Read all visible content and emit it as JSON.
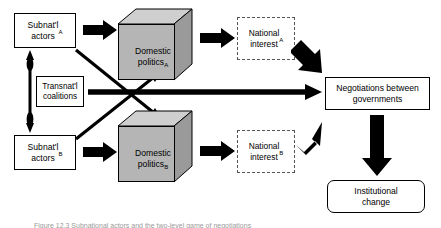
{
  "figure": {
    "caption": "Figure 12.3   Subnational actors and the two-level game of negotiations"
  },
  "nodes": {
    "subnational_actors_a": {
      "label": "Subnat'l\nactors",
      "subscript": "A",
      "shape": "rectangle",
      "border": "solid"
    },
    "subnational_actors_b": {
      "label": "Subnat'l\nactors",
      "subscript": "B",
      "shape": "rectangle",
      "border": "solid"
    },
    "transnational_coalitions": {
      "label": "Transnat'l\ncoalitions",
      "subscript": "",
      "shape": "rectangle",
      "border": "solid"
    },
    "domestic_politics_a": {
      "label": "Domestic\npolitics",
      "subscript": "A",
      "shape": "cube",
      "fill": "#b5b5b5"
    },
    "domestic_politics_b": {
      "label": "Domestic\npolitics",
      "subscript": "B",
      "shape": "cube",
      "fill": "#b5b5b5"
    },
    "national_interest_a": {
      "label": "National\ninterest",
      "subscript": "A",
      "shape": "rectangle",
      "border": "dashed"
    },
    "national_interest_b": {
      "label": "National\ninterest",
      "subscript": "B",
      "shape": "rectangle",
      "border": "dashed"
    },
    "negotiations": {
      "label": "Negotiations between\ngovernments",
      "subscript": "",
      "shape": "rectangle",
      "border": "solid"
    },
    "institutional_change": {
      "label": "Institutional\nchange",
      "subscript": "",
      "shape": "rounded-rectangle",
      "border": "solid"
    }
  },
  "edges": [
    {
      "name": "subnat-a-to-domestic-a",
      "from": "subnational_actors_a",
      "to": "domestic_politics_a",
      "style": "block-arrow",
      "direction": "right"
    },
    {
      "name": "subnat-b-to-domestic-b",
      "from": "subnational_actors_b",
      "to": "domestic_politics_b",
      "style": "block-arrow",
      "direction": "right"
    },
    {
      "name": "domestic-a-to-national-interest-a",
      "from": "domestic_politics_a",
      "to": "national_interest_a",
      "style": "block-arrow",
      "direction": "right"
    },
    {
      "name": "domestic-b-to-national-interest-b",
      "from": "domestic_politics_b",
      "to": "national_interest_b",
      "style": "block-arrow",
      "direction": "right"
    },
    {
      "name": "subnat-a-to-domestic-b-diagonal",
      "from": "subnational_actors_a",
      "to": "domestic_politics_b",
      "style": "line-arrow",
      "direction": "down-right"
    },
    {
      "name": "subnat-b-to-domestic-a-diagonal",
      "from": "subnational_actors_b",
      "to": "domestic_politics_a",
      "style": "line-arrow",
      "direction": "up-right"
    },
    {
      "name": "subnat-a-to-subnat-b-link",
      "from": "subnational_actors_a",
      "to": "subnational_actors_b",
      "style": "double-headed-arrow",
      "direction": "vertical"
    },
    {
      "name": "coalitions-to-negotiations",
      "from": "transnational_coalitions",
      "to": "negotiations",
      "style": "thick-arrow",
      "direction": "right"
    },
    {
      "name": "national-interest-a-to-negotiations",
      "from": "national_interest_a",
      "to": "negotiations",
      "style": "block-arrow",
      "direction": "down-right"
    },
    {
      "name": "national-interest-b-to-negotiations",
      "from": "national_interest_b",
      "to": "negotiations",
      "style": "block-arrow",
      "direction": "up-right"
    },
    {
      "name": "negotiations-to-institutional-change",
      "from": "negotiations",
      "to": "institutional_change",
      "style": "block-arrow",
      "direction": "down"
    }
  ],
  "colors": {
    "background": "#ffffff",
    "stroke": "#000000",
    "cube_fill": "#b5b5b5",
    "cube_top": "#cfcfcf",
    "cube_side": "#9a9a9a",
    "dashed_border": "#555555",
    "caption_text": "#9a9a9a"
  }
}
